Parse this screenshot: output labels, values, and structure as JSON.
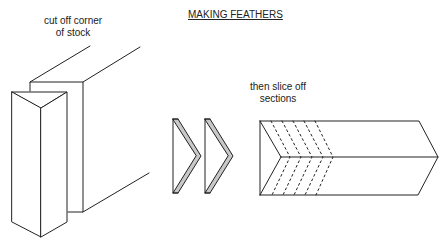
{
  "title": "MAKING FEATHERS",
  "labels": {
    "cut_corner_line1": "cut off corner",
    "cut_corner_line2": "of stock",
    "slice_line1": "then slice off",
    "slice_line2": "sections"
  },
  "colors": {
    "line": "#222222",
    "feather_fill": "#c8c8c8",
    "background": "#ffffff"
  }
}
